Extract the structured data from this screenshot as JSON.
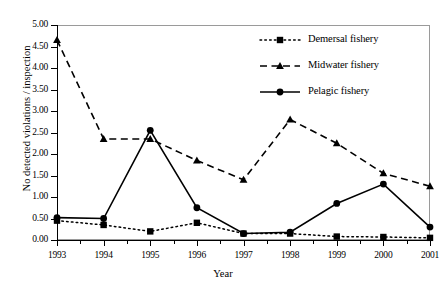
{
  "chart_data": {
    "type": "line",
    "title": "",
    "xlabel": "Year",
    "ylabel": "No detected violations / inspection",
    "categories": [
      "1993",
      "1994",
      "1995",
      "1996",
      "1997",
      "1998",
      "1999",
      "2000",
      "2001"
    ],
    "xlim": [
      1993,
      2001
    ],
    "ylim": [
      0.0,
      5.0
    ],
    "ytick_step": 0.5,
    "ytick_labels": [
      "0.00",
      "0.50",
      "1.00",
      "1.50",
      "2.00",
      "2.50",
      "3.00",
      "3.50",
      "4.00",
      "4.50",
      "5.00"
    ],
    "ytick_values": [
      0.0,
      0.5,
      1.0,
      1.5,
      2.0,
      2.5,
      3.0,
      3.5,
      4.0,
      4.5,
      5.0
    ],
    "grid": false,
    "legend_position": "upper-right-inside",
    "series": [
      {
        "name": "Demersal fishery",
        "marker": "square",
        "line_style": "dotted",
        "color": "#000000",
        "values": [
          0.45,
          0.35,
          0.2,
          0.4,
          0.15,
          0.15,
          0.08,
          0.07,
          0.05
        ]
      },
      {
        "name": "Midwater fishery",
        "marker": "triangle",
        "line_style": "dashed",
        "color": "#000000",
        "values": [
          4.65,
          2.35,
          2.35,
          1.85,
          1.4,
          2.8,
          2.25,
          1.55,
          1.25
        ]
      },
      {
        "name": "Pelagic fishery",
        "marker": "circle",
        "line_style": "solid",
        "color": "#000000",
        "values": [
          0.52,
          0.5,
          2.55,
          0.75,
          0.15,
          0.18,
          0.85,
          1.3,
          0.3
        ]
      }
    ]
  },
  "legend": {
    "items": [
      {
        "label": "Demersal fishery",
        "style": "dotted-square"
      },
      {
        "label": "Midwater fishery",
        "style": "dashed-triangle"
      },
      {
        "label": "Pelagic fishery",
        "style": "solid-circle"
      }
    ]
  }
}
